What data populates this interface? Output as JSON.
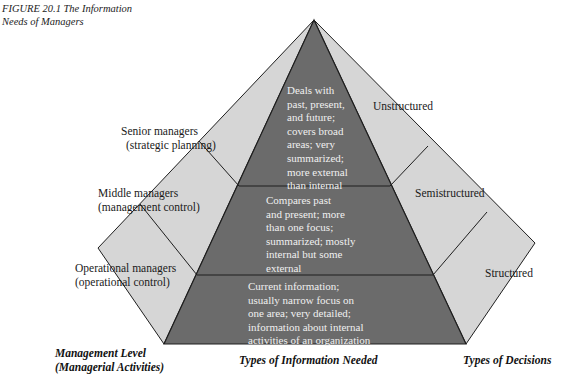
{
  "figure": {
    "caption_line1": "FIGURE 20.1   The Information",
    "caption_line2": "Needs of Managers"
  },
  "colors": {
    "front_face": "#6b6b6b",
    "side_face": "#d6d6d6",
    "edge": "#1e1e1e",
    "info_text": "#f0f0f0"
  },
  "management_levels": [
    {
      "line1": "Senior managers",
      "line2": "(strategic planning)"
    },
    {
      "line1": "Middle managers",
      "line2": "(management control)"
    },
    {
      "line1": "Operational managers",
      "line2": "(operational control)"
    }
  ],
  "information_needed": [
    {
      "lines": [
        "Deals with",
        "past, present,",
        "and future;",
        "covers broad",
        "areas; very",
        "summarized;",
        "more external",
        "than internal"
      ]
    },
    {
      "lines": [
        "Compares past",
        "and present; more",
        "than one focus;",
        "summarized; mostly",
        "internal but some",
        "external"
      ]
    },
    {
      "lines": [
        "Current information;",
        "usually narrow focus on",
        "one area; very detailed;",
        "information about internal",
        "activities of an organization"
      ]
    }
  ],
  "decision_types": [
    {
      "label": "Unstructured"
    },
    {
      "label": "Semistructured"
    },
    {
      "label": "Structured"
    }
  ],
  "axis_labels": {
    "management_level_line1": "Management Level",
    "management_level_line2": "(Managerial Activities)",
    "information_types": "Types of Information Needed",
    "decision_types": "Types of Decisions"
  }
}
